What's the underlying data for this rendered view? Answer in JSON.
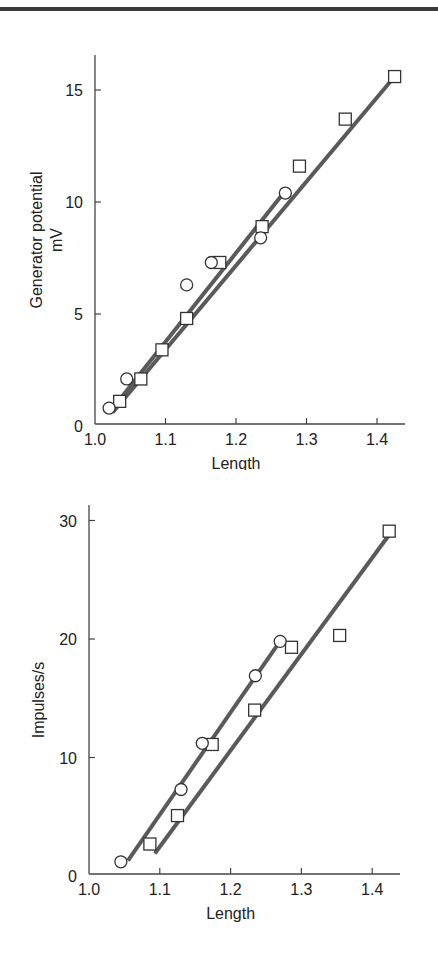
{
  "chart_data": [
    {
      "type": "scatter",
      "title": "",
      "xlabel": "Length",
      "ylabel": "Generator potential mV",
      "ylabel_lines": [
        "Generator potential",
        "mV"
      ],
      "xlim": [
        1.0,
        1.44
      ],
      "ylim": [
        0,
        16.5
      ],
      "xticks": [
        "1.0",
        "1.1",
        "1.2",
        "1.3",
        "1.4"
      ],
      "yticks": [
        "0",
        "5",
        "10",
        "15"
      ],
      "grid": false,
      "legend": null,
      "series": [
        {
          "name": "squares",
          "marker": "square",
          "x": [
            1.035,
            1.065,
            1.095,
            1.13,
            1.177,
            1.237,
            1.29,
            1.355,
            1.425
          ],
          "y": [
            1.1,
            2.1,
            3.4,
            4.8,
            7.3,
            8.9,
            11.6,
            13.7,
            15.6
          ],
          "fit_line": {
            "x": [
              1.025,
              1.425
            ],
            "y": [
              0.6,
              15.6
            ]
          }
        },
        {
          "name": "circles",
          "marker": "circle",
          "x": [
            1.02,
            1.045,
            1.13,
            1.165,
            1.235,
            1.27
          ],
          "y": [
            0.8,
            2.1,
            6.3,
            7.3,
            8.4,
            10.4
          ],
          "fit_line": {
            "x": [
              1.028,
              1.27
            ],
            "y": [
              0.9,
              10.5
            ]
          }
        }
      ]
    },
    {
      "type": "scatter",
      "title": "",
      "xlabel": "Length",
      "ylabel": "Impulses/s",
      "xlim": [
        1.0,
        1.44
      ],
      "ylim": [
        0,
        31.5
      ],
      "xticks": [
        "1.0",
        "1.1",
        "1.2",
        "1.3",
        "1.4"
      ],
      "yticks": [
        "0",
        "10",
        "20",
        "30"
      ],
      "grid": false,
      "legend": null,
      "series": [
        {
          "name": "squares",
          "marker": "square",
          "x": [
            1.086,
            1.125,
            1.174,
            1.234,
            1.286,
            1.354,
            1.424
          ],
          "y": [
            2.7,
            5.1,
            11.1,
            14.0,
            19.3,
            20.3,
            29.1
          ],
          "fit_line": {
            "x": [
              1.093,
              1.424
            ],
            "y": [
              1.9,
              28.8
            ]
          }
        },
        {
          "name": "circles",
          "marker": "circle",
          "x": [
            1.045,
            1.13,
            1.16,
            1.235,
            1.27
          ],
          "y": [
            1.2,
            7.3,
            11.2,
            16.9,
            19.8
          ],
          "fit_line": {
            "x": [
              1.055,
              1.265
            ],
            "y": [
              1.3,
              19.4
            ]
          }
        }
      ]
    }
  ]
}
